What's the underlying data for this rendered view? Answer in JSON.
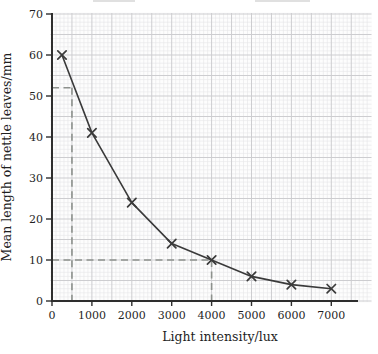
{
  "figure": {
    "background": "#ffffff",
    "paper_color": "#fdfdfd"
  },
  "chart_data": {
    "type": "line",
    "title": "",
    "xlabel": "Light intensity/lux",
    "ylabel": "Mean length of nettle leaves/mm",
    "x": [
      250,
      1000,
      2000,
      3000,
      4000,
      5000,
      6000,
      7000
    ],
    "y": [
      60,
      41,
      24,
      14,
      10,
      6,
      4,
      3
    ],
    "marker": "x",
    "line_style": "solid",
    "xlim": [
      0,
      8000
    ],
    "ylim": [
      0,
      70
    ],
    "x_ticks": [
      0,
      1000,
      2000,
      3000,
      4000,
      5000,
      6000,
      7000
    ],
    "y_ticks": [
      0,
      10,
      20,
      30,
      40,
      50,
      60,
      70
    ],
    "grid": "graph-paper",
    "grid_minor_x_lux": 100,
    "grid_major_x_lux": 500,
    "grid_minor_y_mm": 1,
    "grid_major_y_mm": 5,
    "legend": "none",
    "guides": [
      {
        "name": "reading-at-500-lux",
        "x_lux": 500,
        "y_mm": 52
      },
      {
        "name": "reading-at-4000-lux",
        "x_lux": 4000,
        "y_mm": 10
      }
    ],
    "colors": {
      "curve": "#3a3a3a",
      "marker": "#3a3a3a",
      "axis": "#2e2e2e",
      "tick_text": "#1f1f1f",
      "guide": "#8d918d",
      "grid_minor": "#e6e6e8",
      "grid_major": "#cdcdd0",
      "paper": "#fdfdfd"
    }
  }
}
